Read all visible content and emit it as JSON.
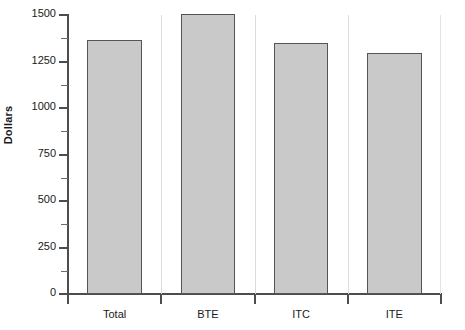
{
  "chart_data": {
    "type": "bar",
    "title": "",
    "xlabel": "",
    "ylabel": "Dollars",
    "categories": [
      "Total",
      "BTE",
      "ITC",
      "ITE"
    ],
    "values": [
      1365,
      1505,
      1350,
      1295
    ],
    "ylim": [
      0,
      1500
    ],
    "y_ticks": [
      0,
      250,
      500,
      750,
      1000,
      1250,
      1500
    ],
    "y_tick_labels": [
      "0",
      "250",
      "500",
      "750",
      "1000",
      "1250",
      "1500"
    ],
    "y_minor_ticks": [
      125,
      375,
      625,
      875,
      1125,
      1375
    ],
    "grid": false,
    "legend": null,
    "bar_fill_color": "#c9c9c9",
    "bar_border_color": "#555555",
    "axis_color": "#4d4d4d",
    "panel_separator_color": "#dcdcdc",
    "background_color": "#ffffff",
    "series": [
      {
        "name": "Dollars",
        "values": [
          1365,
          1505,
          1350,
          1295
        ]
      }
    ],
    "points": [
      {
        "category": "Total",
        "value": 1365
      },
      {
        "category": "BTE",
        "value": 1505
      },
      {
        "category": "ITC",
        "value": 1350
      },
      {
        "category": "ITE",
        "value": 1295
      }
    ]
  }
}
